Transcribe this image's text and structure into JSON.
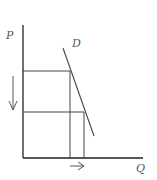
{
  "diagram": {
    "title": "",
    "type": "supply-demand-price-decrease",
    "axes": {
      "y_label": "P",
      "x_label": "Q"
    },
    "curve": {
      "label": "D",
      "name": "demand curve"
    },
    "annotations": {
      "price_change_arrow": "down",
      "quantity_change_arrow": "right"
    },
    "colors": {
      "axis": "#222222",
      "lines": "#444444",
      "label": "#555555",
      "background": "#ffffff"
    }
  }
}
